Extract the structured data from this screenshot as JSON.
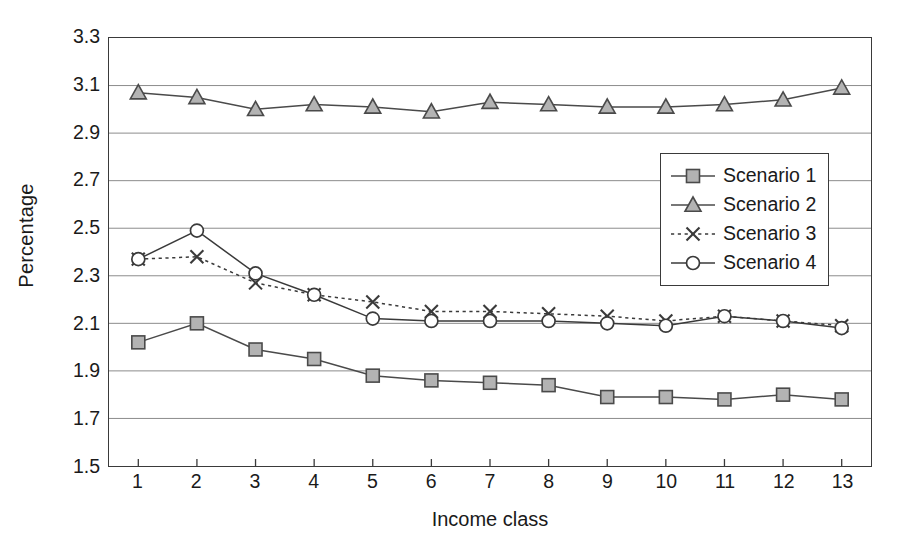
{
  "chart_data": {
    "type": "line",
    "title": "",
    "xlabel": "Income class",
    "ylabel": "Percentage",
    "categories": [
      "1",
      "2",
      "3",
      "4",
      "5",
      "6",
      "7",
      "8",
      "9",
      "10",
      "11",
      "12",
      "13"
    ],
    "ylim": [
      1.5,
      3.3
    ],
    "yticks": [
      "3.3",
      "3.1",
      "2.9",
      "2.7",
      "2.5",
      "2.3",
      "2.1",
      "1.9",
      "1.7",
      "1.5"
    ],
    "ytick_values": [
      3.3,
      3.1,
      2.9,
      2.7,
      2.5,
      2.3,
      2.1,
      1.9,
      1.7,
      1.5
    ],
    "grid": true,
    "legend_position": "upper-right-inside",
    "series": [
      {
        "name": "Scenario 1",
        "marker": "filled-square",
        "line": "solid",
        "color": "#4a4a4a",
        "fill": "#b3b3b3",
        "values": [
          2.02,
          2.1,
          1.99,
          1.95,
          1.88,
          1.86,
          1.85,
          1.84,
          1.79,
          1.79,
          1.78,
          1.8,
          1.78
        ]
      },
      {
        "name": "Scenario 2",
        "marker": "filled-triangle",
        "line": "solid",
        "color": "#4a4a4a",
        "fill": "#b3b3b3",
        "values": [
          3.07,
          3.05,
          3.0,
          3.02,
          3.01,
          2.99,
          3.03,
          3.02,
          3.01,
          3.01,
          3.02,
          3.04,
          3.09
        ]
      },
      {
        "name": "Scenario 3",
        "marker": "x-cross",
        "line": "dotted",
        "color": "#3a3a3a",
        "fill": "none",
        "values": [
          2.37,
          2.38,
          2.27,
          2.22,
          2.19,
          2.15,
          2.15,
          2.14,
          2.13,
          2.11,
          2.13,
          2.11,
          2.09
        ]
      },
      {
        "name": "Scenario 4",
        "marker": "open-circle",
        "line": "solid",
        "color": "#3a3a3a",
        "fill": "#ffffff",
        "values": [
          2.37,
          2.49,
          2.31,
          2.22,
          2.12,
          2.11,
          2.11,
          2.11,
          2.1,
          2.09,
          2.13,
          2.11,
          2.08
        ]
      }
    ]
  },
  "legend": {
    "items": [
      {
        "label": "Scenario 1"
      },
      {
        "label": "Scenario 2"
      },
      {
        "label": "Scenario 3"
      },
      {
        "label": "Scenario 4"
      }
    ]
  },
  "axes": {
    "y_title": "Percentage",
    "x_title": "Income class"
  }
}
